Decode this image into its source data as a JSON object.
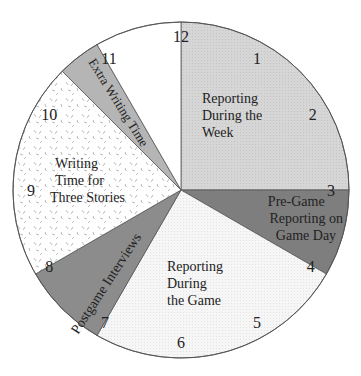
{
  "chart_data": {
    "type": "pie",
    "title": "",
    "unit": "hours (clock face)",
    "categories": [
      "Reporting During the Week",
      "Pre-Game Reporting on Game Day",
      "Reporting During the Game",
      "Postgame Interviews",
      "Writing Time for Three Stories",
      "Extra Writing Time",
      "Unlabeled"
    ],
    "values": [
      3,
      1,
      3,
      1,
      2.5,
      0.5,
      1
    ],
    "slices": [
      {
        "label": "Reporting During the Week",
        "start_hour": 0,
        "end_hour": 3,
        "color": "#d4d4d4",
        "pattern": "fine-dots"
      },
      {
        "label": "Pre-Game Reporting on Game Day",
        "start_hour": 3,
        "end_hour": 4,
        "color": "#7e7e7e",
        "pattern": "none"
      },
      {
        "label": "Reporting During the Game",
        "start_hour": 4,
        "end_hour": 7,
        "color": "#f3f3f3",
        "pattern": "fine-grid"
      },
      {
        "label": "Postgame Interviews",
        "start_hour": 7,
        "end_hour": 8,
        "color": "#8c8c8c",
        "pattern": "none"
      },
      {
        "label": "Writing Time for Three Stories",
        "start_hour": 8,
        "end_hour": 10.5,
        "color": "#ffffff",
        "pattern": "dashes"
      },
      {
        "label": "Extra Writing Time",
        "start_hour": 10.5,
        "end_hour": 11,
        "color": "#b5b5b5",
        "pattern": "none"
      },
      {
        "label": "",
        "start_hour": 11,
        "end_hour": 12,
        "color": "#ffffff",
        "pattern": "none"
      }
    ],
    "clock_numbers": [
      "12",
      "1",
      "2",
      "3",
      "4",
      "5",
      "6",
      "7",
      "8",
      "9",
      "10",
      "11"
    ],
    "legend": "none"
  },
  "labels": {
    "week": [
      "Reporting",
      "During the",
      "Week"
    ],
    "pregame": [
      "Pre-Game",
      "Reporting on",
      "Game Day"
    ],
    "game": [
      "Reporting",
      "During",
      "the Game"
    ],
    "postgame": "Postgame Interviews",
    "writing": [
      "Writing",
      "Time for",
      "Three Stories"
    ],
    "extra": "Extra Writing Time"
  }
}
